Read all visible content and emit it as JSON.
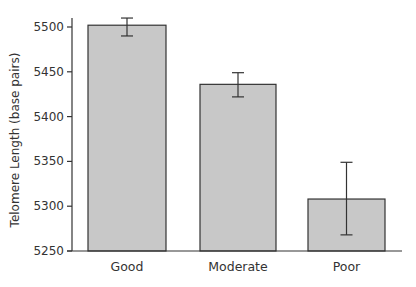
{
  "chart_data": {
    "type": "bar",
    "title": "",
    "xlabel": "",
    "ylabel": "Telomere Length (base pairs)",
    "categories": [
      "Good",
      "Moderate",
      "Poor"
    ],
    "values": [
      5502,
      5436,
      5308
    ],
    "error_bars": [
      {
        "lower": 5490,
        "upper": 5510
      },
      {
        "lower": 5422,
        "upper": 5449
      },
      {
        "lower": 5268,
        "upper": 5349
      }
    ],
    "ylim": [
      5250,
      5500
    ],
    "yticks": [
      5250,
      5300,
      5350,
      5400,
      5450,
      5500
    ],
    "grid": false,
    "legend": null,
    "colors": {
      "bar_fill": "#c8c8c8",
      "bar_stroke": "#333333",
      "axis": "#333333"
    }
  }
}
